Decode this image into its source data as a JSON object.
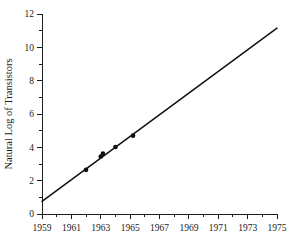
{
  "chart_data": {
    "type": "scatter",
    "title": "",
    "subtitle": "",
    "xlabel": "",
    "ylabel": "Natural Log of Transistors",
    "xlim": [
      1959,
      1975
    ],
    "ylim": [
      0,
      12
    ],
    "grid": false,
    "legend": null,
    "x_tick_labels": [
      "1959",
      "1961",
      "1963",
      "1965",
      "1967",
      "1969",
      "1971",
      "1973",
      "1975"
    ],
    "x_tick_values": [
      1959,
      1961,
      1963,
      1965,
      1967,
      1969,
      1971,
      1973,
      1975
    ],
    "x_minor_tick_values": [
      1960,
      1962,
      1964,
      1966,
      1968,
      1970,
      1972,
      1974
    ],
    "y_tick_labels": [
      "0",
      "2",
      "4",
      "6",
      "8",
      "10",
      "12"
    ],
    "y_tick_values": [
      0,
      2,
      4,
      6,
      8,
      10,
      12
    ],
    "y_minor_tick_values": [
      1,
      3,
      5,
      7,
      9,
      11
    ],
    "series": [
      {
        "name": "observations",
        "type": "scatter",
        "marker": "filled-circle",
        "color": "#0d0d0d",
        "points": [
          {
            "x": 1962.0,
            "y": 2.65
          },
          {
            "x": 1963.0,
            "y": 3.45
          },
          {
            "x": 1963.15,
            "y": 3.62
          },
          {
            "x": 1964.0,
            "y": 4.02
          },
          {
            "x": 1965.2,
            "y": 4.7
          }
        ]
      },
      {
        "name": "fitted-line",
        "type": "line",
        "color": "#101010",
        "endpoints": [
          {
            "x": 1959.0,
            "y": 0.76
          },
          {
            "x": 1975.0,
            "y": 11.15
          }
        ]
      }
    ]
  },
  "axes": {
    "y_axis_title": "Natural Log of Transistors",
    "x_axis_title": ""
  }
}
